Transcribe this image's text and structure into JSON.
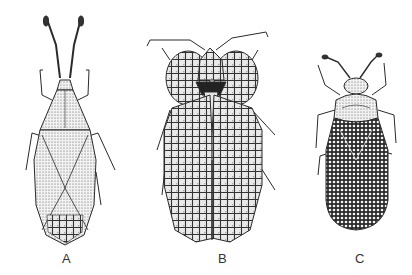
{
  "figure": {
    "background_color": "#ffffff",
    "ink_color": "#2a2a2a",
    "panels": [
      {
        "label": "A",
        "subject": "elongate lace bug with long clubbed antennae"
      },
      {
        "label": "B",
        "subject": "broad lace bug with inflated reticulate hood and paranota"
      },
      {
        "label": "C",
        "subject": "oval lace bug with densely areolate wings"
      }
    ]
  }
}
